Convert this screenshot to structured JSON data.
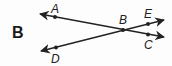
{
  "figure_label": "B",
  "points": {
    "A": "A",
    "B": "B",
    "C": "C",
    "D": "D",
    "E": "E"
  },
  "lines": [
    {
      "name": "line-AC",
      "through": [
        "A",
        "B",
        "C"
      ],
      "direction": "both"
    },
    {
      "name": "line-DE",
      "through": [
        "D",
        "B",
        "E"
      ],
      "direction": "both"
    }
  ],
  "colors": {
    "stroke": "#222222",
    "background": "#fdfdfd"
  }
}
